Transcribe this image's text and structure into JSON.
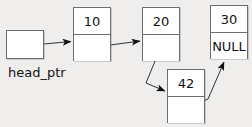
{
  "diagram": {
    "background_color": "#efeeec",
    "box_border_color": "#6e6e6e",
    "box_fill_color": "#ffffff",
    "text_color": "#111111",
    "pointer_label": "head_ptr",
    "nodes": [
      {
        "id": "head",
        "data": "",
        "link": "",
        "has_data_cell": false
      },
      {
        "id": "n10",
        "data": "10",
        "link": ""
      },
      {
        "id": "n20",
        "data": "20",
        "link": ""
      },
      {
        "id": "n42",
        "data": "42",
        "link": ""
      },
      {
        "id": "n30",
        "data": "30",
        "link": "NULL"
      }
    ],
    "edges": [
      {
        "from": "head",
        "to": "n10"
      },
      {
        "from": "n10",
        "to": "n20"
      },
      {
        "from": "n20",
        "to": "n42"
      },
      {
        "from": "n42",
        "to": "n30"
      }
    ]
  }
}
